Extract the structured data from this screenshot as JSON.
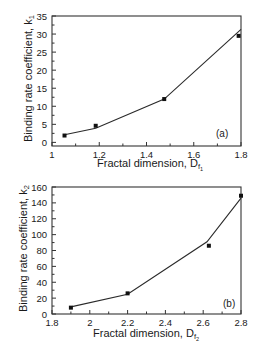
{
  "chart_data": [
    {
      "type": "scatter",
      "panel": "(a)",
      "title": "",
      "xlabel": "Fractal dimension, D",
      "xlabel_sub": "f",
      "xlabel_subsub": "1",
      "ylabel": "Binding rate coefficient, k",
      "ylabel_sub": "1",
      "xlim": [
        1,
        1.8
      ],
      "ylim": [
        -1,
        35
      ],
      "xticks": [
        1,
        1.2,
        1.4,
        1.6,
        1.8
      ],
      "xtick_labels": [
        "1",
        "1.2",
        "1.4",
        "1.6",
        "1.8"
      ],
      "yticks": [
        0,
        5,
        10,
        15,
        20,
        25,
        30,
        35
      ],
      "ytick_labels": [
        "0",
        "5",
        "10",
        "15",
        "20",
        "25",
        "30",
        "35"
      ],
      "grid": false,
      "series": [
        {
          "name": "data",
          "style": "square-markers",
          "x": [
            1.053,
            1.185,
            1.475,
            1.79
          ],
          "y": [
            1.9,
            4.6,
            12.0,
            29.5
          ]
        },
        {
          "name": "fit",
          "style": "line",
          "x": [
            1.053,
            1.185,
            1.475,
            1.8
          ],
          "y": [
            2.1,
            3.9,
            12.0,
            31.3
          ]
        }
      ]
    },
    {
      "type": "scatter",
      "panel": "(b)",
      "title": "",
      "xlabel": "Fractal dimension, D",
      "xlabel_sub": "f",
      "xlabel_subsub": "2",
      "ylabel": "Binding rate coefficient, k",
      "ylabel_sub": "2",
      "xlim": [
        1.8,
        2.8
      ],
      "ylim": [
        0,
        160
      ],
      "xticks": [
        1.8,
        2,
        2.2,
        2.4,
        2.6,
        2.8
      ],
      "xtick_labels": [
        "1.8",
        "2",
        "2.2",
        "2.4",
        "2.6",
        "2.8"
      ],
      "yticks": [
        0,
        20,
        40,
        60,
        80,
        100,
        120,
        140,
        160
      ],
      "ytick_labels": [
        "0",
        "20",
        "40",
        "60",
        "80",
        "100",
        "120",
        "140",
        "160"
      ],
      "grid": false,
      "series": [
        {
          "name": "data",
          "style": "square-markers",
          "x": [
            1.9,
            2.2,
            2.63,
            2.8
          ],
          "y": [
            8,
            26,
            86,
            149
          ]
        },
        {
          "name": "fit",
          "style": "line",
          "x": [
            1.9,
            2.2,
            2.62,
            2.8
          ],
          "y": [
            9,
            25,
            91,
            146
          ]
        }
      ]
    }
  ],
  "panels": {
    "a": {
      "tag": "(a)",
      "xlabel": "Fractal dimension, D",
      "ylabel": "Binding rate coefficient, k"
    },
    "b": {
      "tag": "(b)",
      "xlabel": "Fractal dimension, D",
      "ylabel": "Binding rate coefficient, k"
    }
  }
}
